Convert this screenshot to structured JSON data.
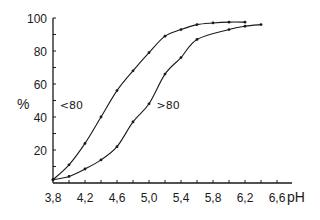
{
  "chart_data": {
    "type": "line",
    "title": "",
    "xlabel": "pH",
    "ylabel": "%",
    "xlim": [
      3.8,
      6.7
    ],
    "ylim": [
      0,
      100
    ],
    "x_ticks": [
      3.8,
      4.2,
      4.6,
      5.0,
      5.4,
      5.8,
      6.2,
      6.6
    ],
    "x_tick_labels": [
      "3,8",
      "4,2",
      "4,6",
      "5,0",
      "5,4",
      "5,8",
      "6,2",
      "6,6"
    ],
    "x_minor_step": 0.2,
    "y_ticks": [
      20,
      40,
      60,
      80,
      100
    ],
    "y_tick_labels": [
      "20",
      "40",
      "60",
      "80",
      "100"
    ],
    "y_minor_step": 10,
    "grid": false,
    "legend": "inline labels",
    "series": [
      {
        "name": "<80",
        "label_pos": [
          4.2,
          47
        ],
        "x": [
          3.8,
          4.0,
          4.2,
          4.4,
          4.6,
          4.8,
          5.0,
          5.2,
          5.4,
          5.6,
          5.8,
          6.0,
          6.2
        ],
        "values": [
          2,
          11,
          24,
          40,
          56,
          68,
          79,
          89,
          93,
          96,
          97,
          97.5,
          97.5
        ]
      },
      {
        "name": ">80",
        "label_pos": [
          5.02,
          47
        ],
        "x": [
          3.8,
          4.0,
          4.2,
          4.4,
          4.6,
          4.8,
          5.0,
          5.2,
          5.4,
          5.6,
          6.0,
          6.2,
          6.4
        ],
        "values": [
          2,
          4,
          8.5,
          14,
          22,
          37,
          48,
          66,
          76,
          87,
          93,
          95,
          96
        ]
      }
    ]
  }
}
